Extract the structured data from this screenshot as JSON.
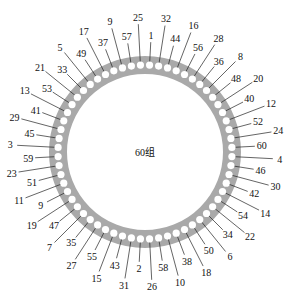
{
  "diagram": {
    "center_label": "60组",
    "ring_color": "#a9a9a9",
    "dot_color": "#ffffff",
    "line_color": "#222222",
    "slot_count": 60,
    "labels_clockwise_from_top": [
      "1",
      "32",
      "44",
      "16",
      "56",
      "28",
      "36",
      "8",
      "48",
      "20",
      "40",
      "12",
      "52",
      "24",
      "60",
      "4",
      "46",
      "30",
      "42",
      "14",
      "54",
      "22",
      "34",
      "6",
      "50",
      "18",
      "38",
      "10",
      "58",
      "26",
      "2",
      "31",
      "43",
      "15",
      "55",
      "27",
      "35",
      "7",
      "47",
      "19",
      "9",
      "11",
      "51",
      "23",
      "59",
      "3",
      "45",
      "29",
      "41",
      "13",
      "53",
      "21",
      "33",
      "5",
      "49",
      "17",
      "37",
      "9",
      "57",
      "25"
    ],
    "label_far": [
      false,
      true,
      false,
      true,
      false,
      true,
      false,
      true,
      false,
      true,
      false,
      true,
      false,
      true,
      false,
      true,
      false,
      true,
      false,
      true,
      false,
      true,
      false,
      true,
      false,
      true,
      false,
      true,
      false,
      true,
      false,
      true,
      false,
      true,
      false,
      true,
      false,
      true,
      false,
      true,
      false,
      true,
      false,
      true,
      false,
      true,
      false,
      true,
      false,
      true,
      false,
      true,
      false,
      true,
      false,
      true,
      false,
      true,
      false,
      true
    ]
  }
}
